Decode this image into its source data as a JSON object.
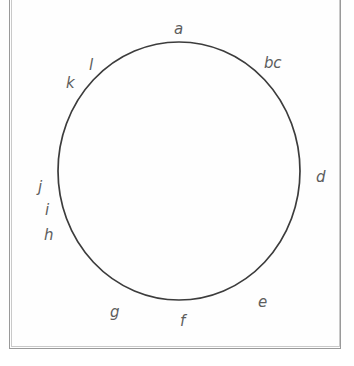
{
  "figure": {
    "type": "circle-with-perimeter-labels",
    "colors": {
      "background": "#ffffff",
      "page_fill": "#fefefe",
      "frame_stroke": "#9a9a9a",
      "circle_stroke": "#3c3c3c",
      "label_text": "#5d5d5d"
    },
    "circle": {
      "center_x": 179,
      "center_y": 171,
      "radius_x": 121,
      "radius_y": 129,
      "stroke_width": 1.6,
      "fill": "none"
    },
    "frame": {
      "left": 9,
      "top": -6,
      "width": 332,
      "height": 355,
      "top_edge_cropped": true
    },
    "labels": [
      {
        "id": "label-a",
        "text": "a",
        "x": 174,
        "y": 22,
        "angle_deg": 90
      },
      {
        "id": "label-bc",
        "text": "bc",
        "x": 264,
        "y": 56,
        "angle_deg": 52
      },
      {
        "id": "label-d",
        "text": "d",
        "x": 316,
        "y": 170,
        "angle_deg": 0
      },
      {
        "id": "label-e",
        "text": "e",
        "x": 258,
        "y": 295,
        "angle_deg": -48
      },
      {
        "id": "label-f",
        "text": "f",
        "x": 180,
        "y": 314,
        "angle_deg": -90
      },
      {
        "id": "label-g",
        "text": "g",
        "x": 110,
        "y": 305,
        "angle_deg": -126
      },
      {
        "id": "label-h",
        "text": "h",
        "x": 44,
        "y": 228,
        "angle_deg": 198
      },
      {
        "id": "label-i",
        "text": "i",
        "x": 45,
        "y": 203,
        "angle_deg": 187
      },
      {
        "id": "label-j",
        "text": "j",
        "x": 38,
        "y": 180,
        "angle_deg": 178
      },
      {
        "id": "label-k",
        "text": "k",
        "x": 66,
        "y": 76,
        "angle_deg": 131
      },
      {
        "id": "label-l",
        "text": "l",
        "x": 89,
        "y": 58,
        "angle_deg": 123
      }
    ]
  }
}
